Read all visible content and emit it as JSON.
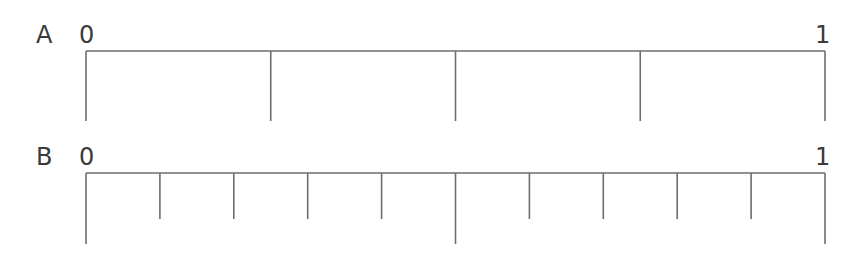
{
  "number_lines": [
    {
      "label": "A",
      "start_label": "0",
      "end_label": "1",
      "divisions": 4,
      "long_tick_positions": [
        0,
        1
      ],
      "short_tick_positions": [
        0.25,
        0.5,
        0.75
      ]
    },
    {
      "label": "B",
      "start_label": "0",
      "end_label": "1",
      "divisions": 10,
      "long_tick_positions": [
        0,
        0.5,
        1
      ],
      "short_tick_positions": [
        0.1,
        0.2,
        0.3,
        0.4,
        0.6,
        0.7,
        0.8,
        0.9
      ]
    }
  ],
  "colors": {
    "line": "#6e6e6e",
    "text": "#3a3a3a",
    "background": "#ffffff"
  }
}
